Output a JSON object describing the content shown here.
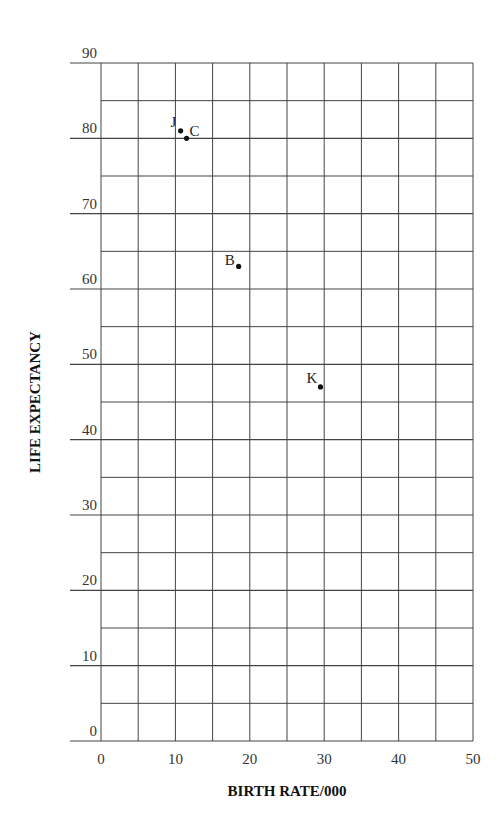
{
  "chart_data": {
    "type": "scatter",
    "title": "",
    "xlabel": "BIRTH RATE/000",
    "ylabel": "LIFE EXPECTANCY",
    "xlim": [
      0,
      50
    ],
    "ylim": [
      0,
      90
    ],
    "x_ticks": [
      0,
      10,
      20,
      30,
      40,
      50
    ],
    "y_ticks": [
      0,
      10,
      20,
      30,
      40,
      50,
      60,
      70,
      80,
      90
    ],
    "grid": true,
    "grid_minor_step": 5,
    "legend": null,
    "points": [
      {
        "label": "J",
        "x": 10.7,
        "y": 81
      },
      {
        "label": "C",
        "x": 11.5,
        "y": 80
      },
      {
        "label": "B",
        "x": 18.5,
        "y": 63
      },
      {
        "label": "K",
        "x": 29.5,
        "y": 47
      }
    ]
  },
  "layout": {
    "left": 101,
    "right": 473,
    "top": 63,
    "bottom": 741,
    "major_ext_left": 70
  }
}
